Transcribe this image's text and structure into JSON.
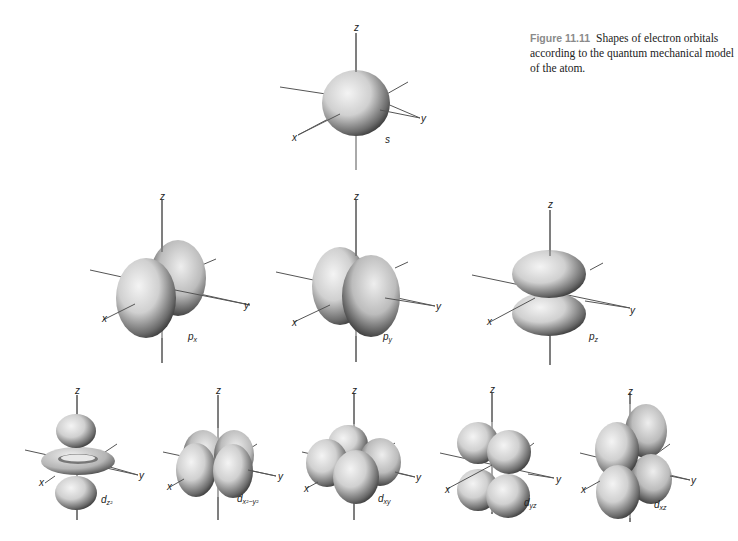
{
  "caption": {
    "figure_number": "Figure 11.11",
    "text": "Shapes of electron orbitals according to the quantum mechanical model of the atom."
  },
  "axes": {
    "x": "x",
    "y": "y",
    "z": "z"
  },
  "orbitals": [
    {
      "id": "s",
      "label": "s",
      "sub": "",
      "row": 1
    },
    {
      "id": "px",
      "label": "p",
      "sub": "x",
      "row": 2
    },
    {
      "id": "py",
      "label": "p",
      "sub": "y",
      "row": 2
    },
    {
      "id": "pz",
      "label": "p",
      "sub": "z",
      "row": 2
    },
    {
      "id": "dz2",
      "label": "d",
      "sub": "z²",
      "row": 3
    },
    {
      "id": "dx2-y2",
      "label": "d",
      "sub": "x²−y²",
      "row": 3
    },
    {
      "id": "dxy",
      "label": "d",
      "sub": "xy",
      "row": 3
    },
    {
      "id": "dyz",
      "label": "d",
      "sub": "yz",
      "row": 3
    },
    {
      "id": "dxz",
      "label": "d",
      "sub": "xz",
      "row": 3
    }
  ],
  "colors": {
    "lobe_light": "#f2f2f2",
    "lobe_mid": "#bdbdbd",
    "lobe_dark": "#2a2a2a",
    "axis": "#555555",
    "caption_number": "#8a8a8a"
  }
}
